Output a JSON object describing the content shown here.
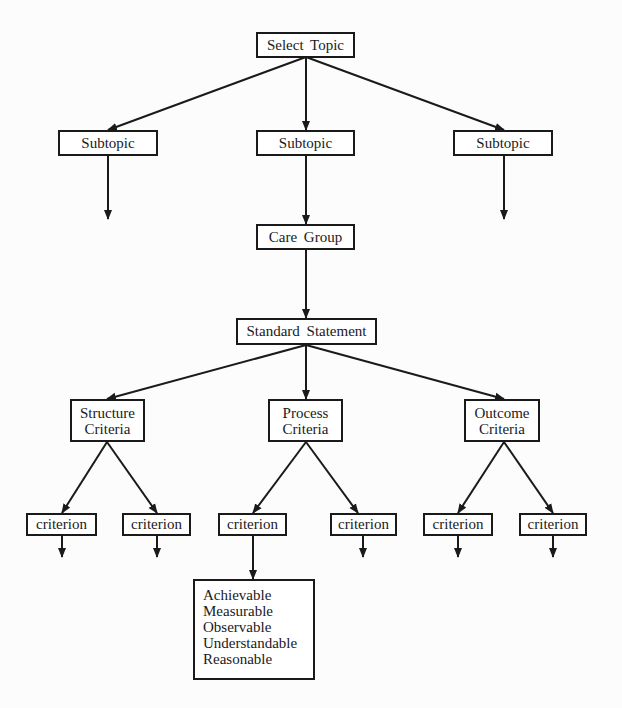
{
  "diagram": {
    "type": "hierarchy",
    "nodes": {
      "select_topic": "Select Topic",
      "subtopic_left": "Subtopic",
      "subtopic_middle": "Subtopic",
      "subtopic_right": "Subtopic",
      "care_group": "Care Group",
      "standard_statement": "Standard Statement",
      "structure_criteria": {
        "line1": "Structure",
        "line2": "Criteria"
      },
      "process_criteria": {
        "line1": "Process",
        "line2": "Criteria"
      },
      "outcome_criteria": {
        "line1": "Outcome",
        "line2": "Criteria"
      },
      "criteria_items": [
        "criterion",
        "criterion",
        "criterion",
        "criterion",
        "criterion",
        "criterion"
      ],
      "criterion_attributes": [
        "Achievable",
        "Measurable",
        "Observable",
        "Understandable",
        "Reasonable"
      ]
    },
    "edges": [
      [
        "Select Topic",
        "Subtopic (left)"
      ],
      [
        "Select Topic",
        "Subtopic (middle)"
      ],
      [
        "Select Topic",
        "Subtopic (right)"
      ],
      [
        "Subtopic (left)",
        "(continues)"
      ],
      [
        "Subtopic (middle)",
        "Care Group"
      ],
      [
        "Subtopic (right)",
        "(continues)"
      ],
      [
        "Care Group",
        "Standard Statement"
      ],
      [
        "Standard Statement",
        "Structure Criteria"
      ],
      [
        "Standard Statement",
        "Process Criteria"
      ],
      [
        "Standard Statement",
        "Outcome Criteria"
      ],
      [
        "Structure Criteria",
        "criterion 1"
      ],
      [
        "Structure Criteria",
        "criterion 2"
      ],
      [
        "Process Criteria",
        "criterion 3"
      ],
      [
        "Process Criteria",
        "criterion 4"
      ],
      [
        "Outcome Criteria",
        "criterion 5"
      ],
      [
        "Outcome Criteria",
        "criterion 6"
      ],
      [
        "criterion 3",
        "Achievable / Measurable / Observable / Understandable / Reasonable"
      ]
    ],
    "colors": {
      "line": "#1a1a1a",
      "box_fill": "#ffffff",
      "background": "#fcfcfc"
    }
  }
}
